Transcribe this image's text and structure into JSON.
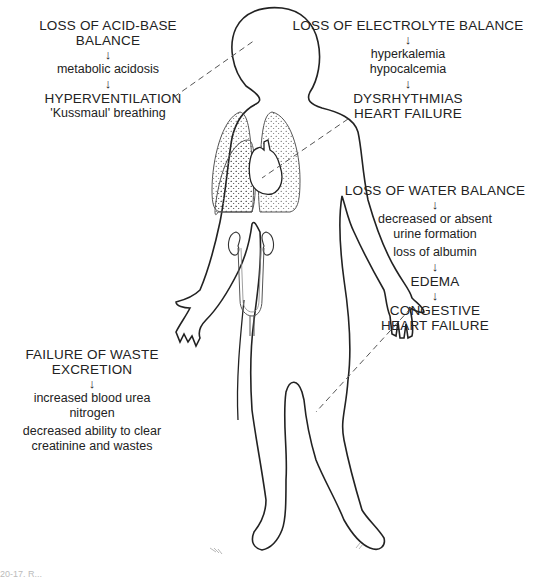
{
  "figure": {
    "type": "anatomical-diagram"
  },
  "blocks": {
    "acid_base": {
      "title": "LOSS OF ACID-BASE BALANCE",
      "arrow": "↓",
      "line1": "metabolic acidosis",
      "arrow2": "↓",
      "result": "HYPERVENTILATION",
      "result2": "'Kussmaul' breathing"
    },
    "electrolyte": {
      "title": "LOSS OF ELECTROLYTE BALANCE",
      "arrow": "↓",
      "line1": "hyperkalemia",
      "line2": "hypocalcemia",
      "arrow2": "↓",
      "result": "DYSRHYTHMIAS",
      "result2": "HEART FAILURE"
    },
    "water": {
      "title": "LOSS OF WATER BALANCE",
      "arrow": "↓",
      "line1": "decreased or absent",
      "line2": "urine formation",
      "line3": "loss of albumin",
      "arrow2": "↓",
      "result": "EDEMA",
      "arrow3": "↓",
      "result2": "CONGESTIVE",
      "result3": "HEART FAILURE"
    },
    "waste": {
      "title": "FAILURE OF WASTE",
      "title2": "EXCRETION",
      "arrow": "↓",
      "line1": "increased blood urea",
      "line2": "nitrogen",
      "line3": "decreased ability to clear",
      "line4": "creatinine and wastes"
    }
  },
  "caption": "20-17. R..."
}
